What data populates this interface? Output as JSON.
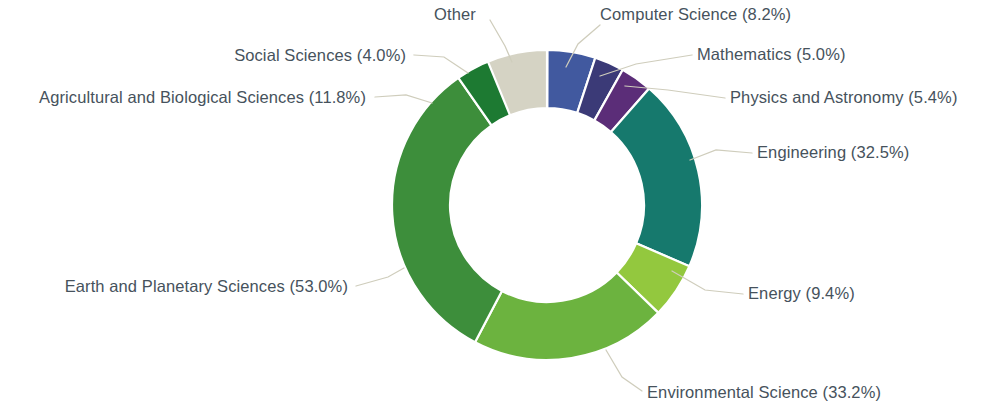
{
  "chart_data": {
    "type": "pie",
    "variant": "donut",
    "title": "",
    "subtitle": "",
    "xlabel": "",
    "ylabel": "",
    "legend_position": "labels-with-leader-lines",
    "grid": false,
    "value_unit": "percent",
    "note": "Percentages sum above 100% because documents may be assigned to multiple subject areas.",
    "categories": [
      "Computer Science",
      "Mathematics",
      "Physics and Astronomy",
      "Engineering",
      "Energy",
      "Environmental Science",
      "Earth and Planetary Sciences",
      "Agricultural and Biological Sciences",
      "Social Sciences",
      "Other"
    ],
    "values": [
      8.2,
      5.0,
      5.4,
      32.5,
      9.4,
      33.2,
      53.0,
      11.8,
      4.0,
      10.1
    ],
    "colors": [
      "#41599f",
      "#3b3a77",
      "#5b2d78",
      "#16796d",
      "#93c83e",
      "#6cb33f",
      "#3d8e3b",
      "#1d7a32",
      "#f3e72a",
      "#d5d3c4"
    ],
    "slices": [
      {
        "key": "computer-science",
        "label": "Computer Science (8.2%)",
        "name": "Computer Science",
        "value": 8.2,
        "color": "#41599f",
        "start_angle": 0.0,
        "end_angle": 18.17,
        "label_x": 600,
        "label_y": 20,
        "anchor": "start",
        "leader": "M 600 25 L 578 44 L 566 67"
      },
      {
        "key": "mathematics",
        "label": "Mathematics (5.0%)",
        "name": "Mathematics",
        "value": 5.0,
        "color": "#3b3a77",
        "start_angle": 18.17,
        "end_angle": 29.25,
        "label_x": 697,
        "label_y": 60,
        "anchor": "start",
        "leader": "M 692 55 L 636 64 L 600 76"
      },
      {
        "key": "physics-and-astronomy",
        "label": "Physics and Astronomy (5.4%)",
        "name": "Physics and Astronomy",
        "value": 5.4,
        "color": "#5b2d78",
        "start_angle": 29.25,
        "end_angle": 41.22,
        "label_x": 730,
        "label_y": 103,
        "anchor": "start",
        "leader": "M 725 98 L 668 90 L 625 86"
      },
      {
        "key": "engineering",
        "label": "Engineering (32.5%)",
        "name": "Engineering",
        "value": 32.5,
        "color": "#16796d",
        "start_angle": 41.22,
        "end_angle": 113.26,
        "label_x": 757,
        "label_y": 158,
        "anchor": "start",
        "leader": "M 752 153 L 716 150 L 690 160"
      },
      {
        "key": "energy",
        "label": "Energy (9.4%)",
        "name": "Energy",
        "value": 9.4,
        "color": "#93c83e",
        "start_angle": 113.26,
        "end_angle": 134.09,
        "label_x": 748,
        "label_y": 299,
        "anchor": "start",
        "leader": "M 743 294 L 705 290 L 672 271"
      },
      {
        "key": "environmental-science",
        "label": "Environmental Science (33.2%)",
        "name": "Environmental Science",
        "value": 33.2,
        "color": "#6cb33f",
        "start_angle": 134.09,
        "end_angle": 207.67,
        "label_x": 647,
        "label_y": 398,
        "anchor": "start",
        "leader": "M 642 391 L 622 377 L 606 350"
      },
      {
        "key": "earth-and-planetary-sciences",
        "label": "Earth and Planetary Sciences (53.0%)",
        "name": "Earth and Planetary Sciences",
        "value": 53.0,
        "color": "#3d8e3b",
        "start_angle": 207.67,
        "end_angle": 325.13,
        "label_x": 348,
        "label_y": 292,
        "anchor": "end",
        "leader": "M 356 286 L 388 277 L 404 268"
      },
      {
        "key": "agricultural-and-biological-sciences",
        "label": "Agricultural and Biological Sciences (11.8%)",
        "name": "Agricultural and Biological Sciences",
        "value": 11.8,
        "color": "#1d7a32",
        "start_angle": 325.13,
        "end_angle": 351.29,
        "label_x": 366,
        "label_y": 103,
        "anchor": "end",
        "leader": "M 375 97 L 406 95 L 432 103"
      },
      {
        "key": "social-sciences",
        "label": "Social Sciences (4.0%)",
        "name": "Social Sciences",
        "value": 4.0,
        "color": "#f3e72a",
        "start_angle": 351.29,
        "end_angle": 360.16,
        "label_x": 406,
        "label_y": 61,
        "anchor": "end",
        "leader": "M 414 55 L 444 57 L 468 73"
      },
      {
        "key": "other",
        "label": "Other",
        "name": "Other",
        "value": 10.1,
        "color": "#d5d3c4",
        "start_angle": 337.6,
        "end_angle": 360.0,
        "label_x": 455,
        "label_y": 20,
        "anchor": "middle",
        "leader": "M 490 20 L 505 46 L 512 62"
      }
    ],
    "geometry": {
      "center_x": 547,
      "center_y": 205,
      "outer_radius": 155,
      "inner_radius": 97,
      "start_at_degrees": 0,
      "direction": "clockwise"
    }
  }
}
